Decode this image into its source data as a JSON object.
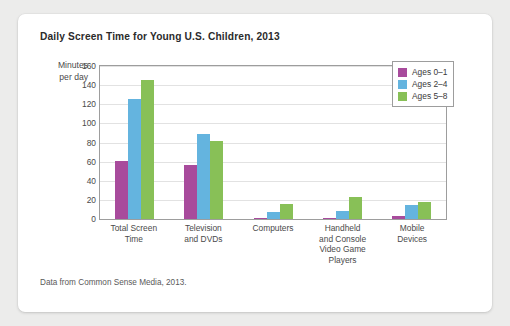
{
  "card": {
    "title": "Daily Screen Time for Young U.S. Children, 2013",
    "source": "Data from Common Sense Media, 2013."
  },
  "axis": {
    "ylabel_line1": "Minutes",
    "ylabel_line2": "per day"
  },
  "legend": {
    "items": [
      {
        "label": "Ages 0–1",
        "color": "#a84b9c"
      },
      {
        "label": "Ages 2–4",
        "color": "#64b4df"
      },
      {
        "label": "Ages 5–8",
        "color": "#88c057"
      }
    ]
  },
  "chart_data": {
    "type": "bar",
    "title": "Daily Screen Time for Young U.S. Children, 2013",
    "xlabel": "",
    "ylabel": "Minutes per day",
    "ylim": [
      0,
      160
    ],
    "yticks": [
      0,
      20,
      40,
      60,
      80,
      100,
      120,
      140,
      160
    ],
    "ytick_labels": [
      "0",
      "20",
      "40",
      "60",
      "80",
      "100",
      "120",
      "140",
      "160"
    ],
    "grid": true,
    "legend_position": "top-right",
    "categories": [
      "Total Screen Time",
      "Television and DVDs",
      "Computers",
      "Handheld and Console Video Game Players",
      "Mobile Devices"
    ],
    "category_labels": [
      [
        "Total Screen",
        "Time"
      ],
      [
        "Television",
        "and DVDs"
      ],
      [
        "Computers"
      ],
      [
        "Handheld",
        "and Console",
        "Video Game",
        "Players"
      ],
      [
        "Mobile",
        "Devices"
      ]
    ],
    "series": [
      {
        "name": "Ages 0–1",
        "color": "#a84b9c",
        "values": [
          61,
          56,
          1,
          1,
          3
        ]
      },
      {
        "name": "Ages 2–4",
        "color": "#64b4df",
        "values": [
          125,
          89,
          7,
          8,
          15
        ]
      },
      {
        "name": "Ages 5–8",
        "color": "#88c057",
        "values": [
          145,
          82,
          16,
          23,
          18
        ]
      }
    ],
    "units": "minutes per day",
    "source": "Data from Common Sense Media, 2013."
  }
}
